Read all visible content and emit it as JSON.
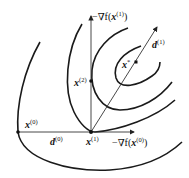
{
  "diagram": {
    "points": [
      {
        "id": "x0",
        "base": "x",
        "sup": "(0)"
      },
      {
        "id": "x1",
        "base": "x",
        "sup": "(1)"
      },
      {
        "id": "x2",
        "base": "x",
        "sup": "(2)"
      },
      {
        "id": "xstar",
        "base": "x",
        "sup": "*"
      }
    ],
    "labels": {
      "grad1_prefix": "−∇f(",
      "grad1_base": "x",
      "grad1_sup": "(1)",
      "grad1_suffix": ")",
      "grad0_prefix": "−∇f(",
      "grad0_base": "x",
      "grad0_sup": "(0)",
      "grad0_suffix": ")",
      "d0_base": "d",
      "d0_sup": "(0)",
      "d1_base": "d",
      "d1_sup": "(1)"
    },
    "contour_count": 4,
    "colors": {
      "ink": "#1a1a1a"
    }
  }
}
